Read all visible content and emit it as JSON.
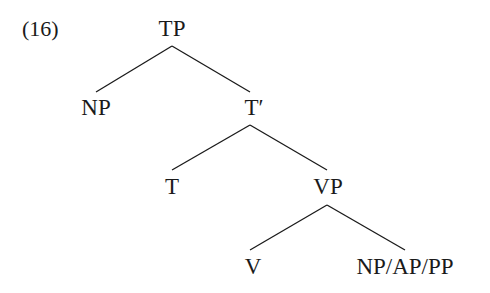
{
  "example_number": "(16)",
  "tree": {
    "nodes": [
      {
        "id": "TP",
        "label": "TP",
        "x": 172,
        "y": 17
      },
      {
        "id": "NP",
        "label": "NP",
        "x": 96,
        "y": 96
      },
      {
        "id": "Tbar",
        "label": "T′",
        "x": 252,
        "y": 96
      },
      {
        "id": "T",
        "label": "T",
        "x": 172,
        "y": 175
      },
      {
        "id": "VP",
        "label": "VP",
        "x": 328,
        "y": 175
      },
      {
        "id": "V",
        "label": "V",
        "x": 253,
        "y": 255
      },
      {
        "id": "Comp",
        "label": "NP/AP/PP",
        "x": 405,
        "y": 255
      }
    ],
    "edges": [
      {
        "from": "TP",
        "to": "NP",
        "x1": 172,
        "y1": 46,
        "x2": 96,
        "y2": 92
      },
      {
        "from": "TP",
        "to": "Tbar",
        "x1": 172,
        "y1": 46,
        "x2": 250,
        "y2": 92
      },
      {
        "from": "Tbar",
        "to": "T",
        "x1": 250,
        "y1": 125,
        "x2": 172,
        "y2": 170
      },
      {
        "from": "Tbar",
        "to": "VP",
        "x1": 250,
        "y1": 125,
        "x2": 327,
        "y2": 170
      },
      {
        "from": "VP",
        "to": "V",
        "x1": 327,
        "y1": 205,
        "x2": 250,
        "y2": 250
      },
      {
        "from": "VP",
        "to": "Comp",
        "x1": 327,
        "y1": 205,
        "x2": 405,
        "y2": 250
      }
    ]
  },
  "colors": {
    "ink": "#1a1a1a",
    "background": "#ffffff"
  }
}
